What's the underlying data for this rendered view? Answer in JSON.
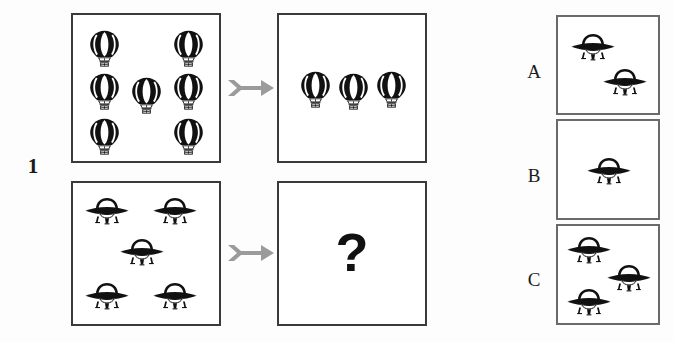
{
  "problem": {
    "number": "1",
    "question_mark": "?"
  },
  "icons": {
    "balloon": "hot-air-balloon-icon",
    "ufo": "ufo-icon",
    "arrow": "right-arrow-icon"
  },
  "matrix": {
    "cells": [
      {
        "name": "top-left",
        "role": "source",
        "icon": "hot-air-balloon-icon",
        "count": 7,
        "positions": [
          {
            "x": 16,
            "y": 15
          },
          {
            "x": 100,
            "y": 15
          },
          {
            "x": 16,
            "y": 58
          },
          {
            "x": 58,
            "y": 62
          },
          {
            "x": 100,
            "y": 58
          },
          {
            "x": 16,
            "y": 103
          },
          {
            "x": 100,
            "y": 103
          }
        ]
      },
      {
        "name": "top-right",
        "role": "result",
        "icon": "hot-air-balloon-icon",
        "count": 3,
        "positions": [
          {
            "x": 21,
            "y": 56
          },
          {
            "x": 59,
            "y": 58
          },
          {
            "x": 97,
            "y": 56
          }
        ]
      },
      {
        "name": "bottom-left",
        "role": "source",
        "icon": "ufo-icon",
        "count": 5,
        "positions": [
          {
            "x": 11,
            "y": 14
          },
          {
            "x": 79,
            "y": 14
          },
          {
            "x": 46,
            "y": 55
          },
          {
            "x": 11,
            "y": 99
          },
          {
            "x": 79,
            "y": 99
          }
        ]
      },
      {
        "name": "bottom-right",
        "role": "unknown",
        "icon": "question-mark",
        "count": 0,
        "positions": []
      }
    ]
  },
  "answers": [
    {
      "label": "A",
      "icon": "ufo-icon",
      "count": 2,
      "positions": [
        {
          "x": 12,
          "y": 16
        },
        {
          "x": 44,
          "y": 51
        }
      ]
    },
    {
      "label": "B",
      "icon": "ufo-icon",
      "count": 1,
      "positions": [
        {
          "x": 28,
          "y": 36
        }
      ]
    },
    {
      "label": "C",
      "icon": "ufo-icon",
      "count": 3,
      "positions": [
        {
          "x": 8,
          "y": 10
        },
        {
          "x": 48,
          "y": 38
        },
        {
          "x": 8,
          "y": 62
        }
      ]
    }
  ],
  "arrows": [
    {
      "name": "arrow-top"
    },
    {
      "name": "arrow-bottom"
    }
  ],
  "colors": {
    "panel_border": "#3a3a3a",
    "answer_border": "#6a6a6a",
    "arrow": "#9b9b9b",
    "ink": "#111111",
    "background": "#fdfdfd"
  }
}
